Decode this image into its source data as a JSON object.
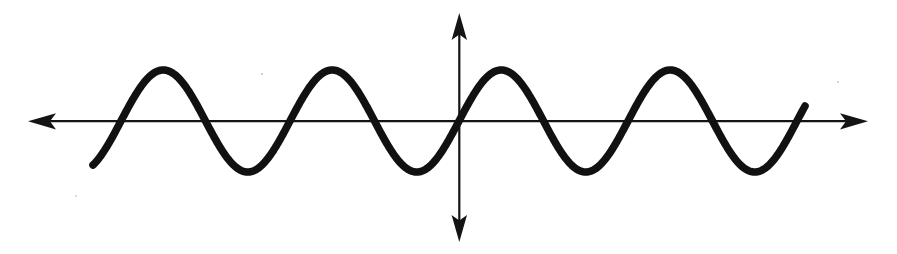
{
  "figure": {
    "background_color": "#ffffff",
    "ink_color": "#111111",
    "axis_color": "#141414",
    "width": 897,
    "height": 254
  },
  "chart_data": {
    "type": "line",
    "title": "",
    "subtitle": "",
    "xlabel": "",
    "ylabel": "",
    "grid": false,
    "legend": null,
    "annotations": [],
    "axes": {
      "horizontal": {
        "y_pixel": 121,
        "x_start_pixel": 28,
        "x_end_pixel": 868,
        "arrowheads": [
          "left",
          "right"
        ],
        "tick_labels": [],
        "stroke_width": 2.2
      },
      "vertical": {
        "x_pixel": 459,
        "y_top_pixel": 13,
        "y_bottom_pixel": 242,
        "arrowheads": [
          "up",
          "down"
        ],
        "tick_labels": [],
        "stroke_width": 2.2
      },
      "origin_pixel": [
        459,
        121
      ],
      "xlim_pixel": [
        28,
        868
      ],
      "ylim_pixel": [
        242,
        13
      ]
    },
    "curve": {
      "function": "y = A * sin(2*pi*(x - x0)/lambda)",
      "amplitude_pixels": 51,
      "wavelength_pixels": 169,
      "period_pixels": 169,
      "cycles_visible": 4.2,
      "phase": "rising zero-crossing at origin",
      "stroke_width": 7.6,
      "x_start_pixel": 93,
      "y_start_pixel": 155,
      "x_end_pixel": 805,
      "y_end_pixel": 97,
      "peaks_x_pixel": [
        159,
        328,
        497,
        666
      ],
      "peaks_y_pixel": [
        70,
        70,
        70,
        70
      ],
      "troughs_x_pixel": [
        243,
        412,
        583,
        752
      ],
      "troughs_y_pixel": [
        172,
        172,
        172,
        172
      ],
      "zero_crossings_x_pixel": [
        117,
        201,
        286,
        370,
        459,
        539,
        624,
        708,
        793
      ],
      "x": [
        93,
        117,
        159,
        201,
        243,
        286,
        328,
        370,
        412,
        459,
        497,
        539,
        583,
        624,
        666,
        708,
        752,
        793,
        805
      ],
      "y": [
        155,
        121,
        70,
        121,
        172,
        121,
        70,
        121,
        172,
        121,
        70,
        121,
        172,
        121,
        70,
        121,
        172,
        121,
        97
      ]
    }
  }
}
